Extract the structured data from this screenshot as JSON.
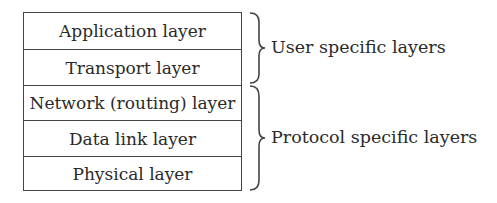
{
  "diagram": {
    "type": "layer-stack",
    "layers": [
      {
        "label": "Application layer"
      },
      {
        "label": "Transport layer"
      },
      {
        "label": "Network (routing) layer"
      },
      {
        "label": "Data link layer"
      },
      {
        "label": "Physical layer"
      }
    ],
    "groups": [
      {
        "label": "User specific layers",
        "spans": [
          "Application layer",
          "Transport layer"
        ]
      },
      {
        "label": "Protocol specific layers",
        "spans": [
          "Network (routing) layer",
          "Data link layer",
          "Physical layer"
        ]
      }
    ]
  }
}
